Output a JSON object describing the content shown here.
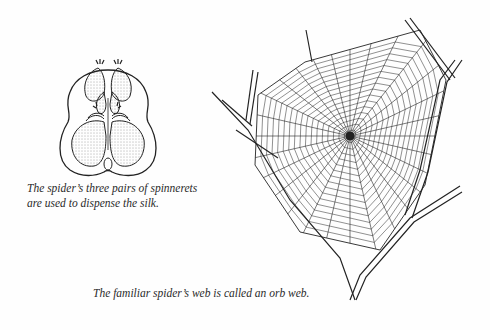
{
  "figures": {
    "spinnerets": {
      "caption_line1": "The spider’s three pairs of spinnerets",
      "caption_line2": "are used to dispense the silk."
    },
    "orb_web": {
      "caption": "The familiar spider’s web is called an orb web."
    }
  },
  "colors": {
    "ink": "#2a2a2a",
    "paper": "#fefefe"
  }
}
